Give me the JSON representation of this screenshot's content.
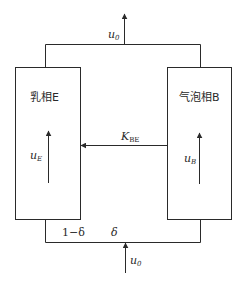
{
  "diagram": {
    "phases": {
      "emulsion": {
        "label": "乳相E",
        "velocity_symbol": "u",
        "velocity_subscript": "E"
      },
      "bubble": {
        "label": "气泡相B",
        "velocity_symbol": "u",
        "velocity_subscript": "B"
      }
    },
    "exchange": {
      "symbol": "K",
      "subscript": "BE"
    },
    "inlet": {
      "symbol": "u",
      "subscript": "0"
    },
    "outlet": {
      "symbol": "u",
      "subscript": "0"
    },
    "split": {
      "emulsion_fraction": "1−δ",
      "bubble_fraction": "δ"
    }
  }
}
